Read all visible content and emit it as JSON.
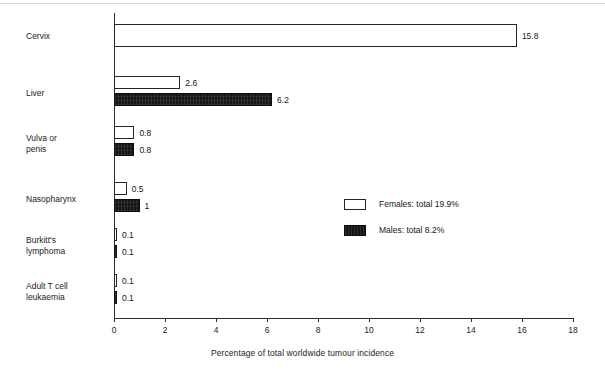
{
  "chart_data": {
    "type": "bar",
    "orientation": "horizontal",
    "title": "",
    "xlabel": "Percentage of total worldwide tumour incidence",
    "ylabel": "",
    "xlim": [
      0,
      18
    ],
    "xticks": [
      "0",
      "2",
      "4",
      "6",
      "8",
      "10",
      "12",
      "14",
      "16",
      "18"
    ],
    "grid": false,
    "legend_position": "center-right-inside",
    "categories": [
      "Cervix",
      "Liver",
      "Vulva or\npenis",
      "Nasopharynx",
      "Burkitt's\nlymphoma",
      "Adult T cell\nleukaemia"
    ],
    "series": [
      {
        "name": "Females: total 19.9%",
        "short_name": "Females",
        "style": "open",
        "color": "#ffffff",
        "edge_color": "#262626",
        "values": [
          15.8,
          2.6,
          0.8,
          0.5,
          0.1,
          0.1
        ],
        "value_labels": [
          "15.8",
          "2.6",
          "0.8",
          "0.5",
          "0.1",
          "0.1"
        ]
      },
      {
        "name": "Males: total 8.2%",
        "short_name": "Males",
        "style": "filled",
        "color": "#151515",
        "edge_color": "#0d0d0d",
        "values": [
          null,
          6.2,
          0.8,
          1,
          0.1,
          0.1
        ],
        "value_labels": [
          "",
          "6.2",
          "0.8",
          "1",
          "0.1",
          "0.1"
        ]
      }
    ]
  },
  "axis": {
    "x_title": "Percentage of total worldwide tumour incidence",
    "ticks": [
      "0",
      "2",
      "4",
      "6",
      "8",
      "10",
      "12",
      "14",
      "16",
      "18"
    ]
  },
  "legend": {
    "entries": [
      {
        "label": "Females: total 19.9%",
        "swatch": "open-square"
      },
      {
        "label": "Males: total 8.2%",
        "swatch": "filled-square"
      }
    ]
  }
}
